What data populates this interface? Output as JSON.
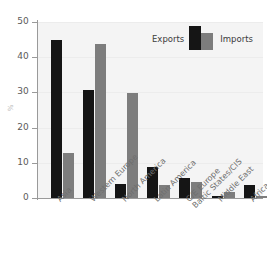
{
  "chart_data": {
    "type": "bar",
    "title": "",
    "xlabel": "",
    "ylabel": "%",
    "ylim": [
      0,
      50
    ],
    "yticks": [
      0,
      10,
      20,
      30,
      40,
      50
    ],
    "grid": true,
    "legend_position": "top-right",
    "categories": [
      "Asia",
      "Western Europe",
      "North America",
      "Latin America",
      "C/E Europe\nBaltic States/CIS",
      "Middle East",
      "Africa"
    ],
    "series": [
      {
        "name": "Exports",
        "color": "#151515",
        "values": [
          45.0,
          30.8,
          3.9,
          8.9,
          5.7,
          0.7,
          3.6
        ]
      },
      {
        "name": "Imports",
        "color": "#7d7d7d",
        "values": [
          12.8,
          43.8,
          29.8,
          3.7,
          4.6,
          1.6,
          0.7
        ]
      }
    ]
  },
  "axis": {
    "y_title": "%",
    "tick_labels": [
      "0",
      "10",
      "20",
      "30",
      "40",
      "50"
    ]
  },
  "legend": {
    "exports_label": "Exports",
    "imports_label": "Imports"
  },
  "xaxis": {
    "labels": [
      {
        "line1": "Asia",
        "line2": ""
      },
      {
        "line1": "Western Europe",
        "line2": ""
      },
      {
        "line1": "North America",
        "line2": ""
      },
      {
        "line1": "Latin America",
        "line2": ""
      },
      {
        "line1": "C/E Europe",
        "line2": "Baltic States/CIS"
      },
      {
        "line1": "Middle East",
        "line2": ""
      },
      {
        "line1": "Africa",
        "line2": ""
      }
    ]
  }
}
